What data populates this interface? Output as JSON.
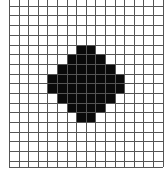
{
  "figure": {
    "grid": {
      "columns": 16,
      "rows": 17,
      "origin_x": 9,
      "origin_y": 5.7,
      "cell_width": 9.6,
      "cell_height": 9.7,
      "top_extension": 5.7,
      "bottom_y": 166.5,
      "line_color": "#555555",
      "background": "#ffffff"
    },
    "shape": {
      "name": "diamond",
      "fill_color": "#0a0a0a",
      "filled_rows": [
        {
          "row": 4,
          "start_col": 7,
          "end_col": 8
        },
        {
          "row": 5,
          "start_col": 6,
          "end_col": 9
        },
        {
          "row": 6,
          "start_col": 5,
          "end_col": 10
        },
        {
          "row": 7,
          "start_col": 4,
          "end_col": 11
        },
        {
          "row": 8,
          "start_col": 4,
          "end_col": 11
        },
        {
          "row": 9,
          "start_col": 5,
          "end_col": 10
        },
        {
          "row": 10,
          "start_col": 6,
          "end_col": 9
        },
        {
          "row": 11,
          "start_col": 7,
          "end_col": 8
        }
      ]
    }
  }
}
